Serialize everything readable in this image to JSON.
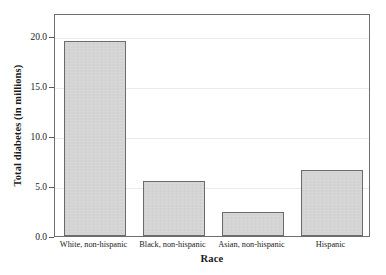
{
  "chart_data": {
    "type": "bar",
    "title": "",
    "xlabel": "Race",
    "ylabel": "Total diabetes (in millions)",
    "categories": [
      "White, non-hispanic",
      "Black, non-hispanic",
      "Asian, non-hispanic",
      "Hispanic"
    ],
    "values": [
      19.5,
      5.45,
      2.35,
      6.6
    ],
    "ylim": [
      0.0,
      22.3
    ],
    "yticks": [
      0.0,
      5.0,
      10.0,
      15.0,
      20.0
    ],
    "ytick_labels": [
      "0.0",
      "5.0",
      "10.0",
      "15.0",
      "20.0"
    ],
    "grid": true,
    "legend": false,
    "bar_fill_color": "#d4d4d4",
    "bar_edge_color": "#6b6b6b",
    "gridline_color": "#ebebeb",
    "frame_color": "#6e6e6e",
    "background_color": "#ffffff"
  },
  "axes": {
    "y_title": "Total diabetes (in millions)",
    "x_title": "Race",
    "y_ticks": [
      {
        "label": "20.0",
        "value": 20.0
      },
      {
        "label": "15.0",
        "value": 15.0
      },
      {
        "label": "10.0",
        "value": 10.0
      },
      {
        "label": "5.0",
        "value": 5.0
      },
      {
        "label": "0.0",
        "value": 0.0
      }
    ],
    "x_ticks": [
      {
        "label": "White, non-hispanic"
      },
      {
        "label": "Black, non-hispanic"
      },
      {
        "label": "Asian, non-hispanic"
      },
      {
        "label": "Hispanic"
      }
    ]
  },
  "bars": [
    {
      "category": "White, non-hispanic",
      "value": 19.5
    },
    {
      "category": "Black, non-hispanic",
      "value": 5.45
    },
    {
      "category": "Asian, non-hispanic",
      "value": 2.35
    },
    {
      "category": "Hispanic",
      "value": 6.6
    }
  ]
}
